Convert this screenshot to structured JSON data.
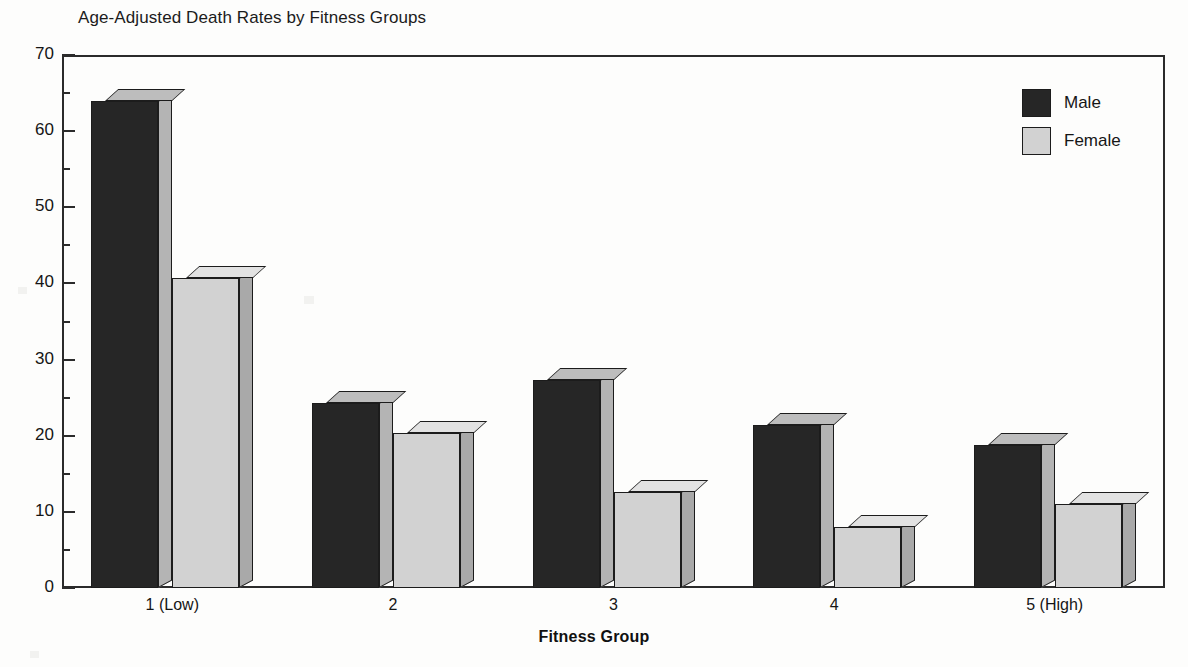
{
  "chart_data": {
    "type": "bar",
    "title": "Age-Adjusted Death Rates by Fitness Groups",
    "xlabel": "Fitness Group",
    "ylabel": "",
    "categories": [
      "1 (Low)",
      "2",
      "3",
      "4",
      "5 (High)"
    ],
    "series": [
      {
        "name": "Male",
        "color": "#262626",
        "values": [
          64,
          24.3,
          27.3,
          21.4,
          18.8
        ]
      },
      {
        "name": "Female",
        "color": "#d2d2d2",
        "values": [
          40.7,
          20.4,
          12.6,
          8.0,
          11.0
        ]
      }
    ],
    "ylim": [
      0,
      70
    ],
    "ytick_labels": [
      "0",
      "10",
      "20",
      "30",
      "40",
      "50",
      "60",
      "70"
    ],
    "ytick_values": [
      0,
      10,
      20,
      30,
      40,
      50,
      60,
      70
    ],
    "yminor_values": [
      5,
      15,
      25,
      35,
      45,
      55,
      65
    ],
    "grid": false,
    "legend_position": "top-right",
    "style": "3d-bar"
  },
  "legend": {
    "items": [
      {
        "label": "Male",
        "swatch": "male-swatch"
      },
      {
        "label": "Female",
        "swatch": "female-swatch"
      }
    ]
  }
}
